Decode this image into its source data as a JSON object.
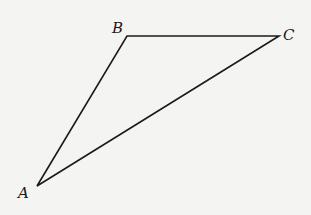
{
  "diagram": {
    "type": "triangle",
    "stroke_color": "#1a1a1a",
    "background_color": "#f4f4f3",
    "vertices": [
      {
        "name": "A",
        "label": "A",
        "x": 37,
        "y": 186,
        "label_x": 18,
        "label_y": 198
      },
      {
        "name": "B",
        "label": "B",
        "x": 127,
        "y": 36,
        "label_x": 112,
        "label_y": 33
      },
      {
        "name": "C",
        "label": "C",
        "x": 279,
        "y": 36,
        "label_x": 283,
        "label_y": 40
      }
    ],
    "edges": [
      {
        "from": "A",
        "to": "B"
      },
      {
        "from": "B",
        "to": "C"
      },
      {
        "from": "C",
        "to": "A"
      }
    ]
  }
}
